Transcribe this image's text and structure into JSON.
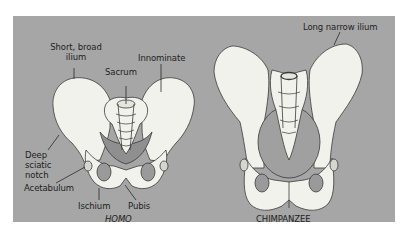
{
  "figure": {
    "background_color": "#a6a6a6",
    "bone_color": "#f2f2ec",
    "outline_color": "#3a3a3a"
  },
  "human": {
    "caption": "HOMO",
    "labels": {
      "short_broad_ilium_line1": "Short, broad",
      "short_broad_ilium_line2": "ilium",
      "innominate": "Innominate",
      "sacrum": "Sacrum",
      "deep_sciatic_notch_line1": "Deep",
      "deep_sciatic_notch_line2": "sciatic",
      "deep_sciatic_notch_line3": "notch",
      "acetabulum": "Acetabulum",
      "ischium": "Ischium",
      "pubis": "Pubis"
    }
  },
  "chimpanzee": {
    "caption": "CHIMPANZEE",
    "labels": {
      "long_narrow_ilium": "Long narrow ilium"
    }
  }
}
